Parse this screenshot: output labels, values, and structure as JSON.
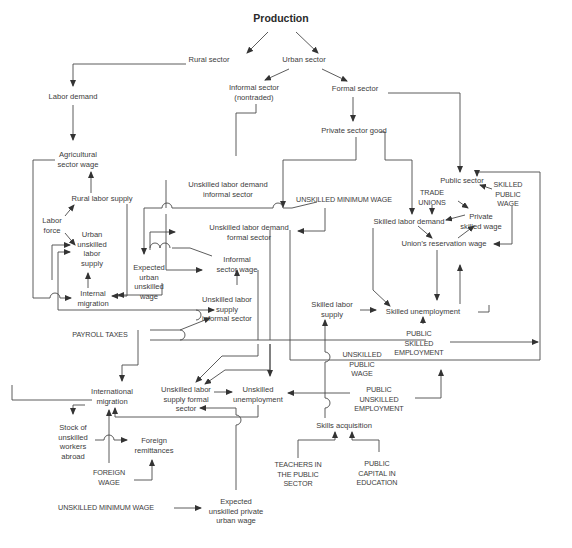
{
  "diagram": {
    "title": "Production",
    "nodes": [
      {
        "id": "production",
        "text": "Production",
        "x": 281,
        "y": 19,
        "kind": "title"
      },
      {
        "id": "rural_sector",
        "text": "Rural sector",
        "x": 209,
        "y": 60
      },
      {
        "id": "urban_sector",
        "text": "Urban sector",
        "x": 304,
        "y": 60
      },
      {
        "id": "labor_demand",
        "text": "Labor demand",
        "x": 73,
        "y": 97
      },
      {
        "id": "informal_sector",
        "text": "Informal sector\n(nontraded)",
        "x": 254,
        "y": 88
      },
      {
        "id": "formal_sector",
        "text": "Formal sector",
        "x": 355,
        "y": 89
      },
      {
        "id": "private_sector_good",
        "text": "Private sector good",
        "x": 354,
        "y": 131
      },
      {
        "id": "agricultural_sector_wage",
        "text": "Agricultural\nsector wage",
        "x": 78,
        "y": 155
      },
      {
        "id": "rural_labor_supply",
        "text": "Rural labor supply",
        "x": 102,
        "y": 199
      },
      {
        "id": "unskilled_demand_informal",
        "text": "Unskilled labor demand\ninformal sector",
        "x": 228,
        "y": 185
      },
      {
        "id": "public_sector",
        "text": "Public sector",
        "x": 462,
        "y": 181
      },
      {
        "id": "skilled_public_wage",
        "text": "SKILLED\nPUBLIC\nWAGE",
        "x": 508,
        "y": 185,
        "kind": "caps"
      },
      {
        "id": "trade_unions",
        "text": "TRADE\nUNIONS",
        "x": 432,
        "y": 193,
        "kind": "caps"
      },
      {
        "id": "unskilled_min_wage_top",
        "text": "UNSKILLED MINIMUM WAGE",
        "x": 344,
        "y": 200,
        "kind": "caps"
      },
      {
        "id": "labor_force",
        "text": "Labor\nforce",
        "x": 52,
        "y": 221
      },
      {
        "id": "private_skilled_wage",
        "text": "Private\nskilled wage",
        "x": 481,
        "y": 217
      },
      {
        "id": "skilled_labor_demand",
        "text": "Skilled labor demand",
        "x": 409,
        "y": 222
      },
      {
        "id": "unskilled_demand_formal",
        "text": "Unskilled labor demand\nformal sector",
        "x": 249,
        "y": 228
      },
      {
        "id": "urban_unskilled_labor_supply",
        "text": "Urban\nunskilled\nlabor\nsupply",
        "x": 92,
        "y": 235
      },
      {
        "id": "unions_reservation_wage",
        "text": "Union’s reservation wage",
        "x": 444,
        "y": 244
      },
      {
        "id": "expected_urban_unskilled_wage",
        "text": "Expected\nurban\nunskilled\nwage",
        "x": 149,
        "y": 268
      },
      {
        "id": "informal_sector_wage",
        "text": "Informal\nsector wage",
        "x": 237,
        "y": 260
      },
      {
        "id": "internal_migration",
        "text": "Internal\nmigration",
        "x": 93,
        "y": 294
      },
      {
        "id": "unskilled_supply_informal",
        "text": "Unskilled labor\nsupply\ninformal sector",
        "x": 227,
        "y": 300
      },
      {
        "id": "skilled_labor_supply",
        "text": "Skilled labor\nsupply",
        "x": 332,
        "y": 305
      },
      {
        "id": "skilled_unemployment",
        "text": "Skilled unemployment",
        "x": 423,
        "y": 312
      },
      {
        "id": "payroll_taxes",
        "text": "PAYROLL TAXES",
        "x": 100,
        "y": 335,
        "kind": "caps"
      },
      {
        "id": "public_skilled_employment",
        "text": "PUBLIC\nSKILLED\nEMPLOYMENT",
        "x": 419,
        "y": 334,
        "kind": "caps"
      },
      {
        "id": "unskilled_public_wage",
        "text": "UNSKILLED\nPUBLIC\nWAGE",
        "x": 362,
        "y": 355,
        "kind": "caps"
      },
      {
        "id": "international_migration",
        "text": "International\nmigration",
        "x": 112,
        "y": 392
      },
      {
        "id": "unskilled_supply_formal",
        "text": "Unskilled labor\nsupply formal\nsector",
        "x": 186,
        "y": 390
      },
      {
        "id": "unskilled_unemployment",
        "text": "Unskilled\nunemployment",
        "x": 258,
        "y": 390
      },
      {
        "id": "public_unskilled_employment",
        "text": "PUBLIC\nUNSKILLED\nEMPLOYMENT",
        "x": 379,
        "y": 390,
        "kind": "caps"
      },
      {
        "id": "stock_unskilled_abroad",
        "text": "Stock of\nunskilled\nworkers\nabroad",
        "x": 73,
        "y": 428
      },
      {
        "id": "foreign_remittances",
        "text": "Foreign\nremittances",
        "x": 154,
        "y": 441
      },
      {
        "id": "skills_acquisition",
        "text": "Skills acquisition",
        "x": 344,
        "y": 426
      },
      {
        "id": "teachers_public_sector",
        "text": "TEACHERS IN\nTHE PUBLIC\nSECTOR",
        "x": 298,
        "y": 465,
        "kind": "caps"
      },
      {
        "id": "public_capital_education",
        "text": "PUBLIC\nCAPITAL IN\nEDUCATION",
        "x": 377,
        "y": 464,
        "kind": "caps"
      },
      {
        "id": "foreign_wage",
        "text": "FOREIGN\nWAGE",
        "x": 109,
        "y": 473,
        "kind": "caps"
      },
      {
        "id": "unskilled_min_wage_bottom",
        "text": "UNSKILLED MINIMUM WAGE",
        "x": 106,
        "y": 508,
        "kind": "caps"
      },
      {
        "id": "expected_unskilled_private_urban_wage",
        "text": "Expected\nunskilled private\nurban wage",
        "x": 236,
        "y": 502
      }
    ],
    "colors": {
      "line": "#4a4a4a",
      "text": "#3c3c3c",
      "background": "#ffffff"
    }
  }
}
